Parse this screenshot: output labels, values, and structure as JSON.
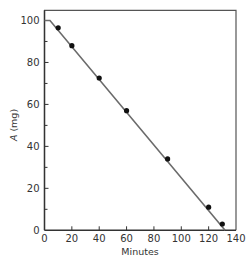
{
  "chart_data": {
    "type": "line",
    "title": "",
    "xlabel": "Minutes",
    "ylabel": "A (mg)",
    "ylabel_italic_part": "A",
    "ylabel_unit_part": " (mg)",
    "xlim": [
      0,
      140
    ],
    "ylim": [
      0,
      100
    ],
    "x_ticks": [
      0,
      20,
      40,
      60,
      80,
      100,
      120,
      140
    ],
    "x_tick_labels": [
      "0",
      "20",
      "40",
      "60",
      "80",
      "100",
      "120",
      "140"
    ],
    "y_ticks": [
      0,
      20,
      40,
      60,
      80,
      100
    ],
    "y_tick_labels": [
      "0",
      "20",
      "40",
      "60",
      "80",
      "100"
    ],
    "y_minor_ticks": [
      10,
      30,
      50,
      70,
      90
    ],
    "grid": false,
    "legend": null,
    "series": [
      {
        "name": "measured",
        "style": "markers",
        "x": [
          10,
          20,
          40,
          60,
          90,
          120,
          130
        ],
        "y": [
          96.5,
          88,
          72.6,
          57,
          34,
          11,
          3
        ]
      },
      {
        "name": "fit",
        "style": "line",
        "x": [
          0,
          4,
          132
        ],
        "y": [
          100,
          100,
          0
        ]
      }
    ],
    "colors": {
      "line": "#6b6b6b",
      "marker": "#111111",
      "axis": "#333333",
      "frame": "#555555"
    }
  }
}
